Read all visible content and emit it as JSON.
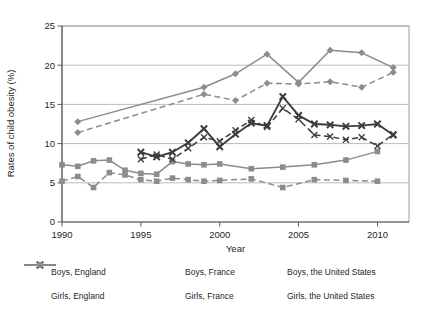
{
  "chart_data": {
    "type": "line",
    "title": "",
    "xlabel": "Year",
    "ylabel": "Rates of child obesity (%)",
    "xlim": [
      1990,
      2012
    ],
    "ylim": [
      0,
      25
    ],
    "xticks": [
      1990,
      1995,
      2000,
      2005,
      2010
    ],
    "yticks": [
      0,
      5,
      10,
      15,
      20,
      25
    ],
    "grid": "horizontal",
    "legend_position": "bottom",
    "colors": {
      "background": "#ffffff",
      "gridline": "#bdbdbd",
      "frame": "#9e9e9e",
      "axis": "#5a5a5a",
      "england": "#3d3d3d",
      "france": "#8c8c8c",
      "united_states": "#8c8c8c",
      "text": "#1f1f1f"
    },
    "series": [
      {
        "name": "Boys, England",
        "sex": "boys",
        "country": "England",
        "color": "#3d3d3d",
        "line": "solid",
        "marker": "x-bold",
        "points": [
          [
            1995,
            8.9
          ],
          [
            1996,
            8.3
          ],
          [
            1997,
            8.9
          ],
          [
            1998,
            10.1
          ],
          [
            1999,
            11.9
          ],
          [
            2000,
            9.6
          ],
          [
            2001,
            11.2
          ],
          [
            2002,
            12.6
          ],
          [
            2003,
            12.3
          ],
          [
            2004,
            16.0
          ],
          [
            2005,
            13.6
          ],
          [
            2006,
            12.5
          ],
          [
            2007,
            12.4
          ],
          [
            2008,
            12.2
          ],
          [
            2009,
            12.3
          ],
          [
            2010,
            12.5
          ],
          [
            2011,
            11.1
          ]
        ]
      },
      {
        "name": "Boys, France",
        "sex": "boys",
        "country": "France",
        "color": "#8c8c8c",
        "line": "solid",
        "marker": "square",
        "points": [
          [
            1990,
            7.3
          ],
          [
            1991,
            7.1
          ],
          [
            1992,
            7.8
          ],
          [
            1993,
            7.9
          ],
          [
            1994,
            6.6
          ],
          [
            1995,
            6.2
          ],
          [
            1996,
            6.1
          ],
          [
            1997,
            7.7
          ],
          [
            1998,
            7.4
          ],
          [
            1999,
            7.3
          ],
          [
            2000,
            7.4
          ],
          [
            2002,
            6.8
          ],
          [
            2004,
            7.0
          ],
          [
            2006,
            7.3
          ],
          [
            2008,
            7.9
          ],
          [
            2010,
            9.0
          ]
        ]
      },
      {
        "name": "Boys, the United States",
        "sex": "boys",
        "country": "United States",
        "color": "#8c8c8c",
        "line": "solid",
        "marker": "diamond",
        "points": [
          [
            1991,
            12.8
          ],
          [
            1999,
            17.2
          ],
          [
            2001,
            18.9
          ],
          [
            2003,
            21.4
          ],
          [
            2005,
            17.8
          ],
          [
            2007,
            21.9
          ],
          [
            2009,
            21.6
          ],
          [
            2011,
            19.7
          ]
        ]
      },
      {
        "name": "Girls, England",
        "sex": "girls",
        "country": "England",
        "color": "#3d3d3d",
        "line": "dashed",
        "marker": "x-thin",
        "points": [
          [
            1995,
            8.0
          ],
          [
            1996,
            8.6
          ],
          [
            1997,
            8.0
          ],
          [
            1998,
            9.4
          ],
          [
            1999,
            10.8
          ],
          [
            2000,
            10.3
          ],
          [
            2001,
            11.7
          ],
          [
            2002,
            13.0
          ],
          [
            2003,
            12.1
          ],
          [
            2004,
            14.5
          ],
          [
            2005,
            13.1
          ],
          [
            2006,
            11.1
          ],
          [
            2007,
            10.9
          ],
          [
            2008,
            10.5
          ],
          [
            2009,
            10.8
          ],
          [
            2010,
            9.7
          ],
          [
            2011,
            11.2
          ]
        ]
      },
      {
        "name": "Girls, France",
        "sex": "girls",
        "country": "France",
        "color": "#8c8c8c",
        "line": "dashed",
        "marker": "square",
        "points": [
          [
            1990,
            5.2
          ],
          [
            1991,
            5.8
          ],
          [
            1992,
            4.4
          ],
          [
            1993,
            6.3
          ],
          [
            1994,
            6.0
          ],
          [
            1995,
            5.4
          ],
          [
            1996,
            5.2
          ],
          [
            1997,
            5.6
          ],
          [
            1998,
            5.4
          ],
          [
            1999,
            5.2
          ],
          [
            2000,
            5.3
          ],
          [
            2002,
            5.5
          ],
          [
            2004,
            4.4
          ],
          [
            2006,
            5.4
          ],
          [
            2008,
            5.3
          ],
          [
            2010,
            5.2
          ]
        ]
      },
      {
        "name": "Girls, the United States",
        "sex": "girls",
        "country": "United States",
        "color": "#8c8c8c",
        "line": "dashed",
        "marker": "diamond",
        "points": [
          [
            1991,
            11.4
          ],
          [
            1999,
            16.3
          ],
          [
            2001,
            15.5
          ],
          [
            2003,
            17.7
          ],
          [
            2005,
            17.6
          ],
          [
            2007,
            17.9
          ],
          [
            2009,
            17.2
          ],
          [
            2011,
            19.1
          ]
        ]
      }
    ]
  }
}
